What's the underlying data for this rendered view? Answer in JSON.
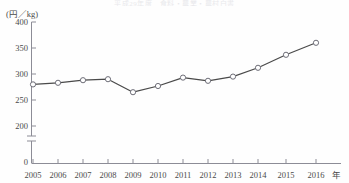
{
  "title_faint": "平成29年度　食料・農業・農村白書",
  "axis": {
    "y_unit_label": "(円／kg)",
    "x_unit_label": "年",
    "y_ticks": [
      400,
      350,
      300,
      250,
      200
    ],
    "y_zero_label": "0",
    "y_axis_break": true
  },
  "chart_data": {
    "type": "line",
    "title": "",
    "subtitle": "",
    "xlabel": "年",
    "ylabel": "(円／kg)",
    "categories": [
      "2005",
      "2006",
      "2007",
      "2008",
      "2009",
      "2010",
      "2011",
      "2012",
      "2013",
      "2014",
      "2015",
      "2016"
    ],
    "values": [
      280,
      283,
      288,
      290,
      265,
      277,
      293,
      287,
      295,
      312,
      337,
      360
    ],
    "ylim": [
      200,
      400
    ],
    "ytick_step": 50,
    "y_axis_broken_to_zero": true,
    "grid": false,
    "legend": null,
    "marker": "open-circle",
    "line_color": "#4a4a4a",
    "marker_fill": "#ffffff",
    "axis_color": "#8c8c96"
  },
  "colors": {
    "line": "#4a4a4a",
    "axis": "#8c8c96",
    "text": "#4a4a4a",
    "background": "#fefefe",
    "marker_stroke": "#6e6e78"
  }
}
